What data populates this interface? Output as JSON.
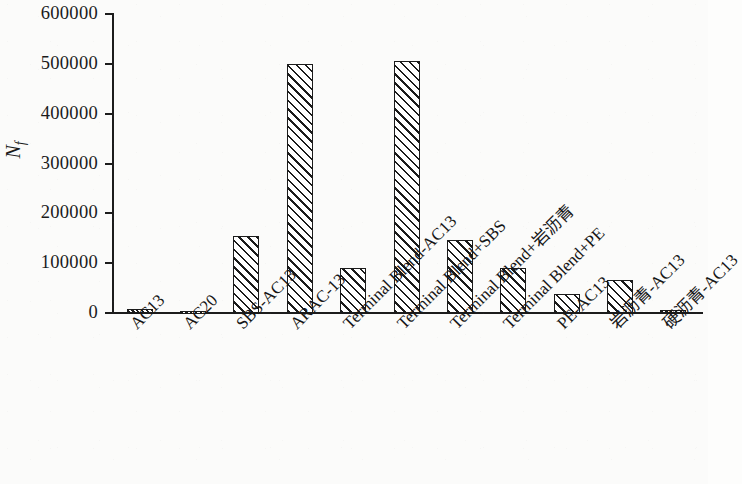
{
  "chart_data": {
    "type": "bar",
    "title": "",
    "subtitle": "",
    "xlabel": "",
    "ylabel": "N_f",
    "ylabel_base": "N",
    "ylabel_sub": "f",
    "ylim": [
      0,
      600000
    ],
    "ytick_values": [
      0,
      100000,
      200000,
      300000,
      400000,
      500000,
      600000
    ],
    "ytick_labels": [
      "0",
      "100000",
      "200000",
      "300000",
      "400000",
      "500000",
      "600000"
    ],
    "grid": false,
    "legend": null,
    "legend_position": "none",
    "bar_style": {
      "fill": "#ffffff",
      "edge_color": "#1b1b1b",
      "hatch": "forward-diagonal",
      "hatch_color": "#1b1b1b"
    },
    "categories": [
      "AC13",
      "AC20",
      "SBS-AC13",
      "ARAC-13",
      "Terminal Blend-AC13",
      "Terminal Blend+SBS",
      "Terminal Blend+岩沥青",
      "Terminal Blend+PE",
      "PE-AC13",
      "岩沥青-AC13",
      "硬沥青-AC13"
    ],
    "values": [
      8000,
      5000,
      155000,
      500000,
      91000,
      505000,
      147000,
      90000,
      38000,
      67000,
      7000
    ]
  }
}
